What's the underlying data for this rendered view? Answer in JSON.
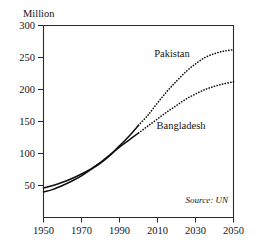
{
  "chart_data": {
    "type": "line",
    "title": "",
    "subtitle": "",
    "xlabel": "",
    "ylabel": "Million",
    "xlim": [
      1950,
      2050
    ],
    "ylim": [
      0,
      300
    ],
    "grid": false,
    "legend_position": "inline-annotation",
    "xticks": [
      "1950",
      "1970",
      "1990",
      "2010",
      "2030",
      "2050"
    ],
    "xtick_values": [
      1950,
      1970,
      1990,
      2010,
      2030,
      2050
    ],
    "yticks": [
      "50",
      "100",
      "150",
      "200",
      "250",
      "300"
    ],
    "ytick_values": [
      50,
      100,
      150,
      200,
      250,
      300
    ],
    "x": [
      1950,
      1955,
      1960,
      1965,
      1970,
      1975,
      1980,
      1985,
      1990,
      1995,
      2000,
      2005,
      2010,
      2015,
      2020,
      2025,
      2030,
      2035,
      2040,
      2045,
      2050
    ],
    "series": [
      {
        "name": "Pakistan",
        "label": "Pakistan",
        "style": "solid-then-dotted",
        "projection_starts": 2000,
        "values": [
          40,
          44,
          50,
          57,
          65,
          75,
          85,
          97,
          112,
          127,
          144,
          160,
          179,
          197,
          213,
          228,
          240,
          250,
          256,
          260,
          262
        ]
      },
      {
        "name": "Bangladesh",
        "label": "Bangladesh",
        "style": "solid-then-dotted",
        "projection_starts": 2000,
        "values": [
          46,
          50,
          55,
          61,
          68,
          76,
          86,
          98,
          110,
          121,
          132,
          143,
          154,
          165,
          175,
          185,
          193,
          200,
          205,
          209,
          212
        ]
      }
    ],
    "annotations": [
      {
        "name": "pakistan-label",
        "text": "Pakistan",
        "x": 2013,
        "y": 252
      },
      {
        "name": "bangladesh-label",
        "text": "Bangladesh",
        "x": 2016,
        "y": 152
      },
      {
        "name": "source-note",
        "text": "Source: UN",
        "x": 2043,
        "y": 22
      }
    ],
    "source_note": "Source: UN"
  },
  "colors": {
    "line": "#0d0d0d",
    "frame": "#2a2a2a",
    "text": "#141414",
    "background": "#ffffff"
  }
}
